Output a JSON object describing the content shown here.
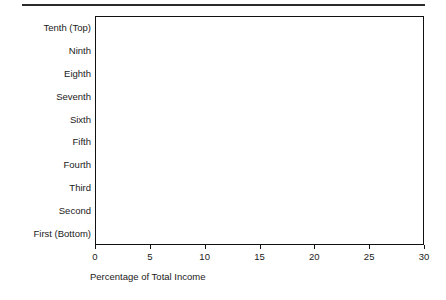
{
  "figure": {
    "top_rule": "horizontal-rule"
  },
  "chart_data": {
    "type": "bar",
    "orientation": "horizontal",
    "title": "",
    "subtitle": "",
    "xlabel": "Percentage of Total Income",
    "ylabel": "",
    "xlim": [
      0,
      30
    ],
    "xticks": [
      0,
      5,
      10,
      15,
      20,
      25,
      30
    ],
    "xtick_labels": [
      "0",
      "5",
      "10",
      "15",
      "20",
      "25",
      "30"
    ],
    "grid": "vertical",
    "legend": "none",
    "bar_color": "#141414",
    "categories": [
      "Tenth (Top)",
      "Ninth",
      "Eighth",
      "Seventh",
      "Sixth",
      "Fifth",
      "Fourth",
      "Third",
      "Second",
      "First (Bottom)"
    ],
    "values": [
      27.0,
      17.0,
      13.6,
      11.2,
      9.3,
      7.4,
      6.0,
      4.4,
      3.2,
      1.7
    ]
  }
}
